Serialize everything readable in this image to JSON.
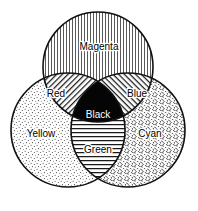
{
  "diagram": {
    "type": "venn",
    "background_color": "#ffffff",
    "outline_color": "#111111",
    "canvas": {
      "width": 198,
      "height": 211
    },
    "circles": [
      {
        "id": "magenta",
        "label": "Magenta",
        "cx": 98,
        "cy": 67,
        "r": 55,
        "fill_pattern": "vertical-lines"
      },
      {
        "id": "yellow",
        "label": "Yellow",
        "cx": 68,
        "cy": 130,
        "r": 57,
        "fill_pattern": "fine-stipple-dots"
      },
      {
        "id": "cyan",
        "label": "Cyan",
        "cx": 128,
        "cy": 130,
        "r": 57,
        "fill_pattern": "dense-squiggles"
      }
    ],
    "intersections": [
      {
        "id": "red",
        "label": "Red",
        "of": [
          "magenta",
          "yellow"
        ],
        "fill_pattern": "diagonal-lines-up"
      },
      {
        "id": "blue",
        "label": "Blue",
        "of": [
          "magenta",
          "cyan"
        ],
        "fill_pattern": "diagonal-lines-down"
      },
      {
        "id": "green",
        "label": "Green",
        "of": [
          "yellow",
          "cyan"
        ],
        "fill_pattern": "horizontal-lines"
      },
      {
        "id": "black",
        "label": "Black",
        "of": [
          "magenta",
          "yellow",
          "cyan"
        ],
        "fill_pattern": "solid-black"
      }
    ],
    "labels": {
      "magenta": {
        "text": "Magenta",
        "x": 99,
        "y": 47
      },
      "yellow": {
        "text": "Yellow",
        "x": 41,
        "y": 134
      },
      "cyan": {
        "text": "Cyan",
        "x": 150,
        "y": 134
      },
      "red": {
        "text": "Red",
        "x": 56,
        "y": 94
      },
      "blue": {
        "text": "Blue",
        "x": 137,
        "y": 94
      },
      "green": {
        "text": "Green",
        "x": 98,
        "y": 150
      },
      "black": {
        "text": "Black",
        "x": 98,
        "y": 115
      }
    }
  }
}
